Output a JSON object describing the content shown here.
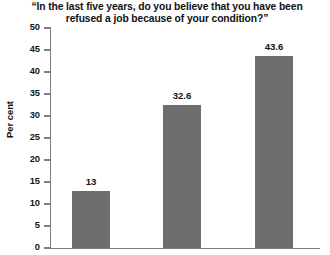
{
  "chart_data": {
    "type": "bar",
    "title": "“In the last five years, do you believe that you have been refused a job because of your condition?”",
    "title_line1": "“In the last five years, do you believe that you have been",
    "title_line2": "refused a job because of your condition?”",
    "categories": [
      "",
      "",
      ""
    ],
    "values": [
      13,
      32.6,
      43.6
    ],
    "value_labels": [
      "13",
      "32.6",
      "43.6"
    ],
    "xlabel": "",
    "ylabel": "Per cent",
    "ylim": [
      0,
      50
    ],
    "ytick_step": 5,
    "yticks": [
      50,
      45,
      40,
      35,
      30,
      25,
      20,
      15,
      10,
      5,
      0
    ],
    "ytick_labels": [
      "50",
      "45",
      "40",
      "35",
      "30",
      "25",
      "20",
      "15",
      "10",
      "5",
      "0"
    ],
    "grid": false,
    "legend": false,
    "bar_color": "#6e6e6e",
    "axis_color": "#7d7d7d",
    "background": "#ffffff"
  }
}
